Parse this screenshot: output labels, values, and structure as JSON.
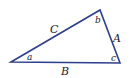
{
  "diagram": {
    "type": "triangle",
    "stroke_color": "#2e3f8f",
    "label_color": "#1a1a2e",
    "vertices": {
      "left": {
        "x": 11,
        "y": 62
      },
      "top": {
        "x": 100,
        "y": 10
      },
      "right": {
        "x": 120,
        "y": 63
      }
    },
    "sides": {
      "A": "A",
      "B": "B",
      "C": "C"
    },
    "angles": {
      "a": "a",
      "b": "b",
      "c": "c"
    }
  }
}
